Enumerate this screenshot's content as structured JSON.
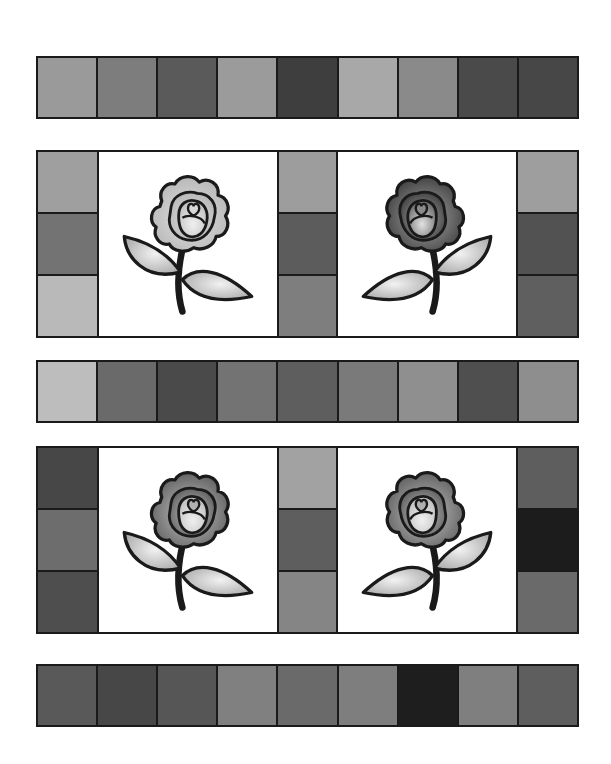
{
  "quilt": {
    "strips": [
      {
        "name": "top-strip",
        "colors": [
          "#9a9a9a",
          "#7d7d7d",
          "#5a5a5a",
          "#9b9b9b",
          "#3e3e3e",
          "#a8a8a8",
          "#8a8a8a",
          "#4a4a4a",
          "#474747"
        ]
      },
      {
        "name": "middle-strip",
        "colors": [
          "#bdbdbd",
          "#6a6a6a",
          "#4a4a4a",
          "#737373",
          "#5e5e5e",
          "#7a7a7a",
          "#8f8f8f",
          "#4f4f4f",
          "#8e8e8e"
        ]
      },
      {
        "name": "bottom-strip",
        "colors": [
          "#595959",
          "#474747",
          "#565656",
          "#808080",
          "#6a6a6a",
          "#7e7e7e",
          "#1e1e1e",
          "#7f7f7f",
          "#5e5e5e"
        ]
      }
    ],
    "block_rows": [
      {
        "name": "upper-block-row",
        "left_column": [
          "#9f9f9f",
          "#737373",
          "#b9b9b9"
        ],
        "middle_column": [
          "#9d9d9d",
          "#5c5c5c",
          "#7e7e7e"
        ],
        "right_column": [
          "#9e9e9e",
          "#525252",
          "#5f5f5f"
        ],
        "roses": [
          {
            "name": "light-rose",
            "petal_outer": "#bdbdbd",
            "petal_inner": "#d6d6d6"
          },
          {
            "name": "dark-rose",
            "petal_outer": "#4a4a4a",
            "petal_inner": "#9a9a9a"
          }
        ]
      },
      {
        "name": "lower-block-row",
        "left_column": [
          "#474747",
          "#6d6d6d",
          "#4e4e4e"
        ],
        "middle_column": [
          "#a2a2a2",
          "#5e5e5e",
          "#858585"
        ],
        "right_column": [
          "#5e5e5e",
          "#1c1c1c",
          "#6a6a6a"
        ],
        "roses": [
          {
            "name": "medium-rose",
            "petal_outer": "#6a6a6a",
            "petal_inner": "#b0b0b0"
          },
          {
            "name": "medium-rose",
            "petal_outer": "#6a6a6a",
            "petal_inner": "#b0b0b0"
          }
        ]
      }
    ],
    "leaf_color": "#c8c8c8",
    "stem_color": "#1a1a1a",
    "outline_color": "#1a1a1a"
  }
}
